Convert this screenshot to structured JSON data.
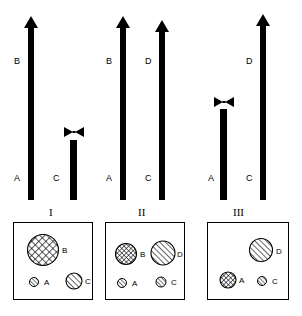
{
  "figure": {
    "title": "",
    "panels": [
      {
        "id": "I",
        "roman_label": "I",
        "bars": [
          {
            "name": "A-to-B",
            "base_label": "A",
            "tip_label": "B",
            "type": "arrow",
            "height_px": 172,
            "x": 30
          },
          {
            "name": "C-truncated",
            "base_label": "C",
            "tip_label": "",
            "type": "x-capped",
            "height_px": 62,
            "x": 71
          }
        ],
        "box": {
          "circles": [
            {
              "label": "B",
              "pattern": "cross-hatch",
              "size": 30,
              "x": 14,
              "y": 12,
              "label_side": "right"
            },
            {
              "label": "A",
              "pattern": "diagonal-hatch",
              "size": 9,
              "x": 16,
              "y": 54,
              "label_side": "right"
            },
            {
              "label": "C",
              "pattern": "diagonal-hatch",
              "size": 16,
              "x": 58,
              "y": 50,
              "label_side": "right"
            }
          ]
        }
      },
      {
        "id": "II",
        "roman_label": "II",
        "bars": [
          {
            "name": "A-to-B",
            "base_label": "A",
            "tip_label": "B",
            "type": "arrow",
            "height_px": 172,
            "x": 22
          },
          {
            "name": "C-to-D",
            "base_label": "C",
            "tip_label": "D",
            "type": "arrow",
            "height_px": 168,
            "x": 60
          }
        ],
        "box": {
          "circles": [
            {
              "label": "B",
              "pattern": "cross-hatch",
              "size": 20,
              "x": 12,
              "y": 20,
              "label_side": "right"
            },
            {
              "label": "D",
              "pattern": "diagonal-hatch",
              "size": 23,
              "x": 50,
              "y": 18,
              "label_side": "right"
            },
            {
              "label": "A",
              "pattern": "diagonal-hatch",
              "size": 9,
              "x": 13,
              "y": 55,
              "label_side": "right"
            },
            {
              "label": "C",
              "pattern": "diagonal-hatch",
              "size": 10,
              "x": 52,
              "y": 54,
              "label_side": "right"
            }
          ]
        }
      },
      {
        "id": "III",
        "roman_label": "III",
        "bars": [
          {
            "name": "A-truncated",
            "base_label": "A",
            "tip_label": "",
            "type": "x-capped",
            "height_px": 104,
            "x": 23
          },
          {
            "name": "C-to-D",
            "base_label": "C",
            "tip_label": "D",
            "type": "arrow",
            "height_px": 175,
            "x": 64
          }
        ],
        "box": {
          "circles": [
            {
              "label": "D",
              "pattern": "diagonal-hatch",
              "size": 22,
              "x": 46,
              "y": 14,
              "label_side": "right"
            },
            {
              "label": "A",
              "pattern": "cross-hatch",
              "size": 16,
              "x": 12,
              "y": 50,
              "label_side": "right"
            },
            {
              "label": "C",
              "pattern": "diagonal-hatch",
              "size": 9,
              "x": 54,
              "y": 55,
              "label_side": "right"
            }
          ]
        }
      }
    ],
    "legend": {
      "symbols": {
        "arrow": "upward-arrow",
        "x-cap": "bowtie-block-marker",
        "cross-hatch": "cross-hatched-circle",
        "diagonal-hatch": "diagonal-hatched-circle"
      }
    },
    "colors": {
      "ink": "#000000",
      "paper": "#ffffff"
    }
  }
}
